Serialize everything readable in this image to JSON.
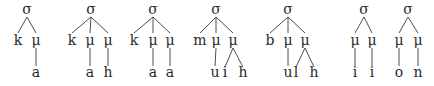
{
  "diagram": {
    "type": "syllable-structure-trees",
    "trees": [
      {
        "root": "σ",
        "children": [
          {
            "label": "k",
            "children": []
          },
          {
            "label": "μ",
            "children": [
              {
                "label": "a"
              }
            ]
          }
        ]
      },
      {
        "root": "σ",
        "children": [
          {
            "label": "k",
            "children": []
          },
          {
            "label": "μ",
            "children": [
              {
                "label": "a"
              }
            ]
          },
          {
            "label": "μ",
            "children": [
              {
                "label": "h"
              }
            ]
          }
        ]
      },
      {
        "root": "σ",
        "children": [
          {
            "label": "k",
            "children": []
          },
          {
            "label": "μ",
            "children": [
              {
                "label": "a"
              }
            ]
          },
          {
            "label": "μ",
            "children": [
              {
                "label": "a"
              }
            ]
          }
        ]
      },
      {
        "root": "σ",
        "children": [
          {
            "label": "m",
            "children": []
          },
          {
            "label": "μ",
            "children": [
              {
                "label": "u"
              }
            ]
          },
          {
            "label": "μ",
            "children": [
              {
                "label": "i"
              },
              {
                "label": "h"
              }
            ]
          }
        ]
      },
      {
        "root": "σ",
        "children": [
          {
            "label": "b",
            "children": []
          },
          {
            "label": "μ",
            "children": [
              {
                "label": "u"
              }
            ]
          },
          {
            "label": "μ",
            "children": [
              {
                "label": "l"
              },
              {
                "label": "h"
              }
            ]
          }
        ]
      },
      {
        "root": "σ",
        "children": [
          {
            "label": "μ",
            "children": [
              {
                "label": "i"
              }
            ]
          },
          {
            "label": "μ",
            "children": [
              {
                "label": "i"
              }
            ]
          }
        ]
      },
      {
        "root": "σ",
        "children": [
          {
            "label": "μ",
            "children": [
              {
                "label": "o"
              }
            ]
          },
          {
            "label": "μ",
            "children": [
              {
                "label": "n"
              }
            ]
          }
        ]
      }
    ]
  }
}
